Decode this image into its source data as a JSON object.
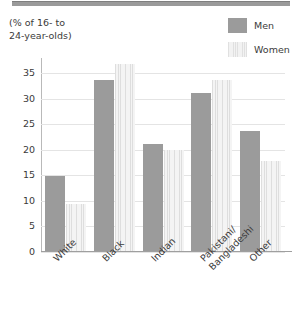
{
  "chart_data": {
    "type": "bar",
    "title": "",
    "subtitle": "",
    "axis_caption": "(% of 16- to\n24-year-olds)",
    "xlabel": "",
    "ylabel": "",
    "ylim": [
      0,
      38
    ],
    "yticks": [
      0,
      5,
      10,
      15,
      20,
      25,
      30,
      35
    ],
    "grid": true,
    "legend_position": "top-right",
    "categories": [
      "White",
      "Black",
      "Indian",
      "Pakistani/\nBangladeshi",
      "Other"
    ],
    "series": [
      {
        "name": "Men",
        "color": "#9b9b9b",
        "values": [
          14.6,
          33.5,
          21.0,
          31.0,
          23.5
        ]
      },
      {
        "name": "Women",
        "color": "#ededed",
        "values": [
          9.3,
          36.6,
          19.8,
          33.5,
          17.7
        ]
      }
    ]
  },
  "legend": {
    "items": [
      {
        "label": "Men"
      },
      {
        "label": "Women"
      }
    ]
  },
  "colors": {
    "men_bar": "#9b9b9b",
    "women_bar": "#ededed",
    "gridline": "#e4e4e4",
    "axis": "#9f9f9f",
    "text": "#3b3b3b",
    "top_rule": "#9a9a9a"
  }
}
